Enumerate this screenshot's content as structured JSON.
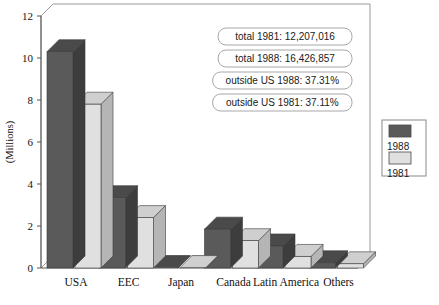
{
  "chart_data": {
    "type": "bar",
    "title": "",
    "subtitle": "",
    "xlabel": "",
    "ylabel": "(Millions)",
    "categories": [
      "USA",
      "EEC",
      "Japan",
      "Canada",
      "Latin America",
      "Others"
    ],
    "series": [
      {
        "name": "1988",
        "values": [
          10.3,
          3.35,
          0.02,
          1.85,
          1.05,
          0.25
        ],
        "color": "#5a5a5a"
      },
      {
        "name": "1981",
        "values": [
          7.8,
          2.4,
          0.02,
          1.3,
          0.55,
          0.2
        ],
        "color": "#e0e0e0"
      }
    ],
    "ylim": [
      0,
      12
    ],
    "yticks": [
      0,
      2,
      4,
      6,
      8,
      10,
      12
    ],
    "ytick_labels": [
      "0",
      "2",
      "4",
      "6",
      "8",
      "10",
      "12"
    ],
    "grid": false,
    "legend_position": "right",
    "style": "3d-column",
    "annotations": [
      "total 1981: 12,207,016",
      "total 1988: 16,426,857",
      "outside US 1988: 37.31%",
      "outside US 1981: 37.11%"
    ]
  },
  "legend": {
    "entries": [
      {
        "label": "1988",
        "color": "#5a5a5a"
      },
      {
        "label": "1981",
        "color": "#e0e0e0"
      }
    ]
  },
  "colors": {
    "series_1988_front": "#5a5a5a",
    "series_1988_top": "#4a4a4a",
    "series_1988_side": "#3d3d3d",
    "series_1981_front": "#e0e0e0",
    "series_1981_top": "#cfcfcf",
    "series_1981_side": "#b5b5b5",
    "frame": "#9a9a9a",
    "axis": "#555555",
    "background": "#ffffff"
  }
}
